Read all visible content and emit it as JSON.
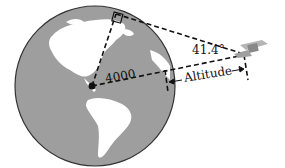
{
  "diagram": {
    "radius_label": "4000",
    "angle_label": "41.4°",
    "altitude_label": "Altitude",
    "colors": {
      "ocean": "#9e9e9e",
      "land": "#ffffff",
      "lines": "#111111",
      "satellite": "#a8a8a8"
    }
  }
}
